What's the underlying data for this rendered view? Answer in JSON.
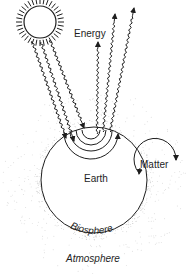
{
  "diagram": {
    "colors": {
      "stroke": "#1e1e1e",
      "background": "#ffffff",
      "stipple": "#8a8a8a"
    },
    "nodes": {
      "sun": {
        "label": "",
        "cx": 40,
        "cy": 22,
        "r": 16
      },
      "earth": {
        "label": "Earth",
        "cx": 94,
        "cy": 180,
        "r": 53
      },
      "matter": {
        "label": "Matter",
        "cx": 158,
        "cy": 165,
        "r": 22
      }
    },
    "labels": {
      "energy": "Energy",
      "earth": "Earth",
      "matter": "Matter",
      "biosphere": "Biosphere",
      "atmosphere": "Atmosphere"
    },
    "flows": {
      "incoming_energy_arrows": 3,
      "outgoing_energy_arrows": 3,
      "matter_cycle": "circular arrows"
    }
  }
}
